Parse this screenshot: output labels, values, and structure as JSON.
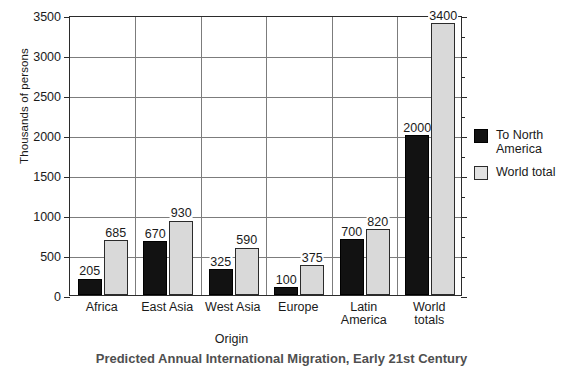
{
  "chart_data": {
    "type": "bar",
    "title": "",
    "caption": "Predicted Annual International Migration, Early 21st Century",
    "xlabel": "Origin",
    "ylabel": "Thousands of persons",
    "ylim": [
      0,
      3500
    ],
    "ytick_step": 500,
    "yticks": [
      "0",
      "500",
      "1000",
      "1500",
      "2000",
      "2500",
      "3000",
      "3500"
    ],
    "grid": true,
    "legend_position": "right",
    "categories": [
      "Africa",
      "East Asia",
      "West Asia",
      "Europe",
      "Latin\nAmerica",
      "World\ntotals"
    ],
    "series": [
      {
        "name": "To North\nAmerica",
        "legend_label": "To North\nAmerica",
        "color": "#121212",
        "values": [
          205,
          670,
          325,
          100,
          700,
          2000
        ]
      },
      {
        "name": "World total",
        "legend_label": "World total",
        "color": "#d9d9d9",
        "values": [
          685,
          930,
          590,
          375,
          820,
          3400
        ]
      }
    ]
  },
  "colors": {
    "axis": "#2b2b2b",
    "grid": "#7c7c7c",
    "series_dark": "#121212",
    "series_light": "#d9d9d9",
    "background": "#ffffff"
  }
}
